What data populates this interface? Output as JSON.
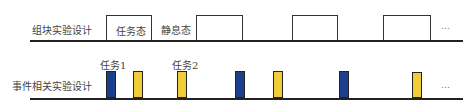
{
  "block_design": {
    "label": "组块实验设计",
    "task_state_label": "任务态",
    "rest_state_label": "静息态",
    "ellipsis": "…",
    "pulses": [
      {
        "x": 106,
        "w": 46
      },
      {
        "x": 196,
        "w": 47
      },
      {
        "x": 292,
        "w": 46
      },
      {
        "x": 383,
        "w": 48
      }
    ]
  },
  "event_design": {
    "label": "事件相关实验设计",
    "task1_label": "任务1",
    "task2_label": "任务2",
    "ellipsis": "…",
    "colors": {
      "task1": "#1b3f8b",
      "task2": "#f2cd3a"
    },
    "bars": [
      {
        "x": 106,
        "type": "task1"
      },
      {
        "x": 133,
        "type": "task2"
      },
      {
        "x": 177,
        "type": "task2"
      },
      {
        "x": 235,
        "type": "task1"
      },
      {
        "x": 273,
        "type": "task2"
      },
      {
        "x": 339,
        "type": "task1"
      },
      {
        "x": 412,
        "type": "task2"
      }
    ]
  }
}
